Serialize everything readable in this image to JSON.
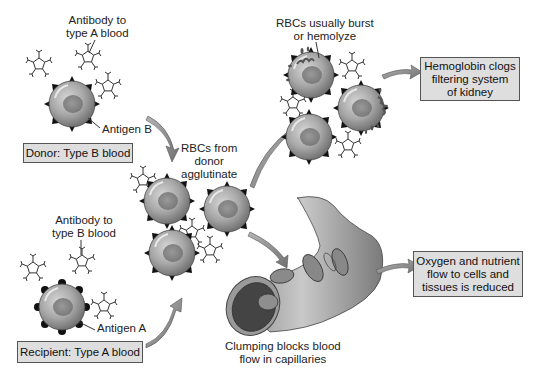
{
  "donor": {
    "antibody_label": [
      "Antibody to",
      "type A blood"
    ],
    "antigen_label": "Antigen B",
    "box_label": "Donor: Type B blood"
  },
  "recipient": {
    "antibody_label": [
      "Antibody to",
      "type B blood"
    ],
    "antigen_label": "Antigen A",
    "box_label": "Recipient: Type A blood"
  },
  "agglutination": {
    "label": [
      "RBCs from",
      "donor",
      "agglutinate"
    ]
  },
  "hemolysis": {
    "label": [
      "RBCs usually burst",
      "or hemolyze"
    ],
    "outcome_box": [
      "Hemoglobin clogs",
      "filtering system",
      "of kidney"
    ]
  },
  "capillary": {
    "label": [
      "Clumping blocks blood",
      "flow in capillaries"
    ],
    "outcome_box": [
      "Oxygen and nutrient",
      "flow to cells and",
      "tissues is reduced"
    ]
  },
  "colors": {
    "box_fill": "#dedede",
    "box_border": "#555555",
    "arrow": "#8a8a8a",
    "cell_fill": "#9a9a9a",
    "nucleus": "#7d7d7d",
    "background": "#ffffff"
  }
}
